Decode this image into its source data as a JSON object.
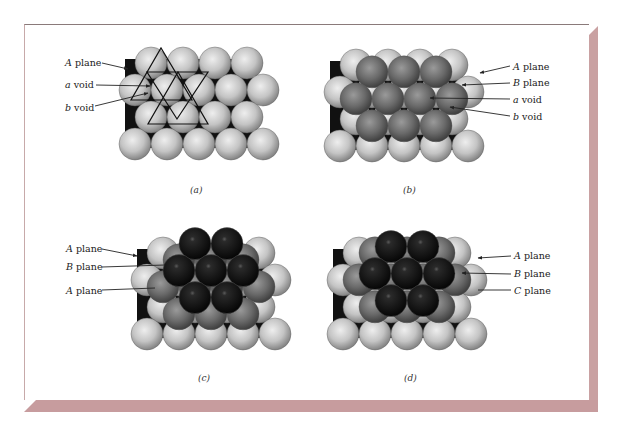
{
  "figure": {
    "panels": [
      {
        "id": "a",
        "caption": "(a)",
        "layers": [
          "A"
        ],
        "labels": [
          {
            "italic": "A",
            "text": " plane",
            "target": "A-layer sphere"
          },
          {
            "italic": "a",
            "text": " void",
            "target": "a void"
          },
          {
            "italic": "b",
            "text": " void",
            "target": "b void"
          }
        ],
        "annotation": "triangles marking a and b voids"
      },
      {
        "id": "b",
        "caption": "(b)",
        "layers": [
          "A",
          "B"
        ],
        "labels": [
          {
            "italic": "A",
            "text": " plane"
          },
          {
            "italic": "B",
            "text": " plane"
          },
          {
            "italic": "a",
            "text": " void"
          },
          {
            "italic": "b",
            "text": " void"
          }
        ]
      },
      {
        "id": "c",
        "caption": "(c)",
        "layers": [
          "A",
          "B",
          "A"
        ],
        "labels": [
          {
            "italic": "A",
            "text": " plane"
          },
          {
            "italic": "B",
            "text": " plane"
          },
          {
            "italic": "A",
            "text": " plane"
          }
        ]
      },
      {
        "id": "d",
        "caption": "(d)",
        "layers": [
          "A",
          "B",
          "C"
        ],
        "labels": [
          {
            "italic": "A",
            "text": " plane"
          },
          {
            "italic": "B",
            "text": " plane"
          },
          {
            "italic": "C",
            "text": " plane"
          }
        ]
      }
    ],
    "colors": {
      "layer_A": "#c8c8c8",
      "layer_B": "#6e6e6e",
      "layer_top": "#1e1e1e",
      "frame_shadow": "#c79c9e"
    }
  }
}
